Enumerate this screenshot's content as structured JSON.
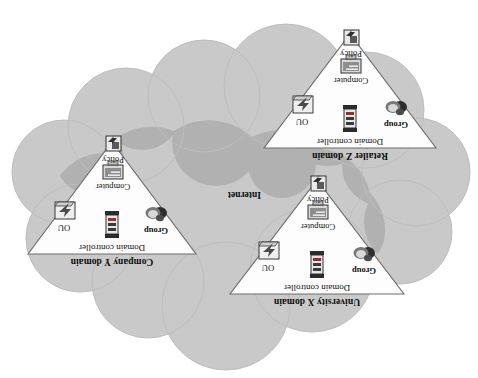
{
  "figure": {
    "internet_label": "Internet",
    "background_color": "#ffffff",
    "cloud_light_color": "#c9c9c9",
    "cloud_dark_color": "#b1b1b1",
    "cloud_outline_color": "#bdbdbd",
    "triangle_fill": "#fdfdfd",
    "triangle_stroke": "#6d6d6d",
    "rotation_degrees": 180
  },
  "domains": [
    {
      "id": "university-x",
      "name": "University X domain",
      "controller_label": "Domain controller",
      "nodes": [
        {
          "key": "group",
          "label": "Group",
          "icon": "group-icon"
        },
        {
          "key": "ou",
          "label": "OU",
          "icon": "ou-folder-icon"
        },
        {
          "key": "computer",
          "label": "Computer",
          "icon": "computer-monitor-icon"
        },
        {
          "key": "policy",
          "label": "Policy",
          "icon": "policy-scroll-icon"
        }
      ]
    },
    {
      "id": "company-y",
      "name": "Company Y domain",
      "controller_label": "Domain controller",
      "nodes": [
        {
          "key": "group",
          "label": "Group",
          "icon": "group-icon"
        },
        {
          "key": "ou",
          "label": "OU",
          "icon": "ou-folder-icon"
        },
        {
          "key": "computer",
          "label": "Computer",
          "icon": "computer-monitor-icon"
        },
        {
          "key": "policy",
          "label": "Policy",
          "icon": "policy-scroll-icon"
        }
      ]
    },
    {
      "id": "retailer-z",
      "name": "Retailer Z domain",
      "controller_label": "Domain controller",
      "nodes": [
        {
          "key": "group",
          "label": "Group",
          "icon": "group-icon"
        },
        {
          "key": "ou",
          "label": "OU",
          "icon": "ou-folder-icon"
        },
        {
          "key": "computer",
          "label": "Computer",
          "icon": "computer-monitor-icon"
        },
        {
          "key": "policy",
          "label": "Policy",
          "icon": "policy-scroll-icon"
        }
      ]
    }
  ]
}
